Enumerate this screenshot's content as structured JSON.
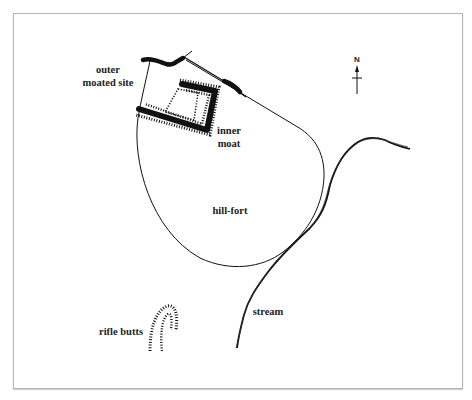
{
  "figure": {
    "type": "site plan",
    "frame_color": "#b4b4b4",
    "ink_color": "#111111"
  },
  "north_arrow": {
    "letter": "N"
  },
  "labels": {
    "outer_moated_site": [
      "outer",
      "moated site"
    ],
    "inner_moat": [
      "inner",
      "moat"
    ],
    "hill_fort": "hill-fort",
    "rifle_butts": "rifle butts",
    "stream": "stream"
  },
  "features": [
    {
      "name": "outer moated site",
      "kind": "earthwork boundary"
    },
    {
      "name": "inner moat",
      "kind": "moat with hachured banks"
    },
    {
      "name": "hill-fort",
      "kind": "enclosure outline"
    },
    {
      "name": "rifle butts",
      "kind": "hachured earthwork"
    },
    {
      "name": "stream",
      "kind": "watercourse"
    }
  ]
}
